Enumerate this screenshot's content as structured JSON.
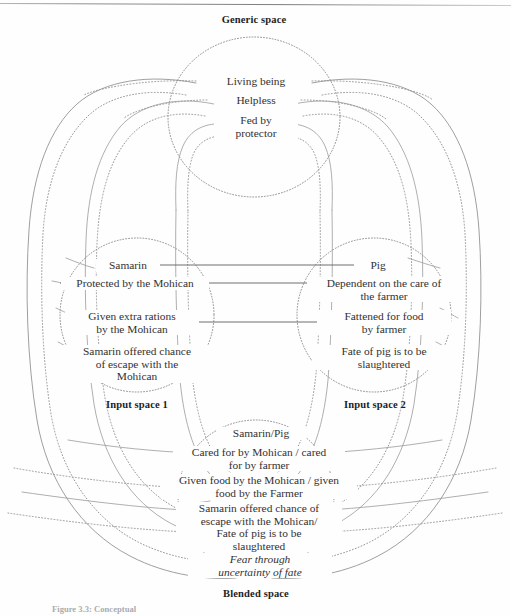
{
  "figure": {
    "caption": "Figure 3.3: Conceptual",
    "ink_color": "#333132",
    "line_color": "#8a8a8a",
    "solid_line_color": "#6f6f6f"
  },
  "generic_space": {
    "title": "Generic space",
    "entries": [
      {
        "text": "Living being"
      },
      {
        "text": "Helpless"
      },
      {
        "text": "Fed by\nprotector"
      }
    ]
  },
  "input_space_1": {
    "title": "Input space 1",
    "entries": [
      {
        "text": "Samarin"
      },
      {
        "text": "Protected by the Mohican"
      },
      {
        "text": "Given extra rations\nby the Mohican"
      },
      {
        "text": "Samarin offered chance\nof escape with the\nMohican"
      }
    ]
  },
  "input_space_2": {
    "title": "Input space 2",
    "entries": [
      {
        "text": "Pig"
      },
      {
        "text": "Dependent on the care of\nthe farmer"
      },
      {
        "text": "Fattened for food\nby farmer"
      },
      {
        "text": "Fate of pig is to be\nslaughtered"
      }
    ]
  },
  "blended_space": {
    "title": "Blended space",
    "entries": [
      {
        "text": "Samarin/Pig",
        "italic": false
      },
      {
        "text": "Cared for by Mohican / cared\nfor by farmer",
        "italic": false
      },
      {
        "text": "Given food by the Mohican / given\nfood by the Farmer",
        "italic": false
      },
      {
        "text": "Samarin offered chance of\nescape with the Mohican/\nFate of pig is to be\nslaughtered",
        "italic": false
      },
      {
        "text": "Fear through\nuncertainty of fate",
        "italic": true
      }
    ]
  },
  "mapping_lines": [
    {
      "from": "Samarin",
      "to": "Pig"
    },
    {
      "from": "Protected by the Mohican",
      "to": "Dependent on the care of the farmer"
    },
    {
      "from": "Given extra rations by the Mohican",
      "to": "Fattened for food by farmer"
    }
  ]
}
